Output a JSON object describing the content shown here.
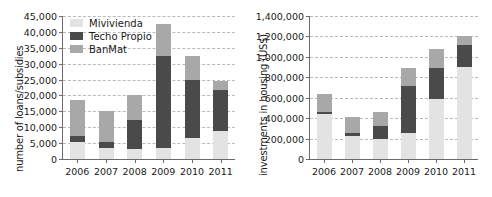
{
  "chart_data": [
    {
      "type": "bar",
      "id": "loans-subsidies",
      "title": "",
      "xlabel": "",
      "ylabel": "number of loans/subsidies",
      "stacked": true,
      "grid": true,
      "legend_position": "top-left",
      "categories": [
        "2006",
        "2007",
        "2008",
        "2009",
        "2010",
        "2011"
      ],
      "ylim": [
        0,
        45000
      ],
      "ytick_step": 5000,
      "ytick_labels": [
        "0",
        "5,000",
        "10,000",
        "15,000",
        "20,000",
        "25,000",
        "30,000",
        "35,000",
        "40,000",
        "45,000"
      ],
      "ytick_values": [
        0,
        5000,
        10000,
        15000,
        20000,
        25000,
        30000,
        35000,
        40000,
        45000
      ],
      "series": [
        {
          "name": "Mivivienda",
          "color": "#e3e3e3",
          "values": [
            5500,
            3600,
            3000,
            3600,
            6500,
            8800
          ]
        },
        {
          "name": "Techo Propio",
          "color": "#4a4a4a",
          "values": [
            1700,
            1800,
            9400,
            28700,
            18500,
            12800
          ]
        },
        {
          "name": "BanMat",
          "color": "#a8a8a8",
          "values": [
            11500,
            9600,
            7600,
            10100,
            7500,
            3000
          ]
        }
      ],
      "totals": [
        18700,
        15000,
        20000,
        42400,
        32500,
        24600
      ]
    },
    {
      "type": "bar",
      "id": "investments-housing",
      "title": "",
      "xlabel": "",
      "ylabel": "investments in housing (US$)",
      "stacked": true,
      "grid": true,
      "legend_position": "none",
      "categories": [
        "2006",
        "2007",
        "2008",
        "2009",
        "2010",
        "2011"
      ],
      "ylim": [
        0,
        1400000
      ],
      "ytick_step": 200000,
      "ytick_labels": [
        "0",
        "200,000",
        "400,000",
        "600,000",
        "800,000",
        "1,000,000",
        "1,200,000",
        "1,400,000"
      ],
      "ytick_values": [
        0,
        200000,
        400000,
        600000,
        800000,
        1000000,
        1200000,
        1400000
      ],
      "series": [
        {
          "name": "Mivivienda",
          "color": "#e3e3e3",
          "values": [
            440000,
            230000,
            195000,
            250000,
            585000,
            905000
          ]
        },
        {
          "name": "Techo Propio",
          "color": "#4a4a4a",
          "values": [
            20000,
            20000,
            130000,
            460000,
            310000,
            215000
          ]
        },
        {
          "name": "BanMat",
          "color": "#a8a8a8",
          "values": [
            175000,
            165000,
            135000,
            180000,
            185000,
            85000
          ]
        }
      ],
      "totals": [
        635000,
        415000,
        460000,
        890000,
        1080000,
        1205000
      ]
    }
  ],
  "legend": {
    "items": [
      {
        "label": "Mivivienda",
        "color": "#e3e3e3"
      },
      {
        "label": "Techo Propio",
        "color": "#4a4a4a"
      },
      {
        "label": "BanMat",
        "color": "#a8a8a8"
      }
    ]
  }
}
